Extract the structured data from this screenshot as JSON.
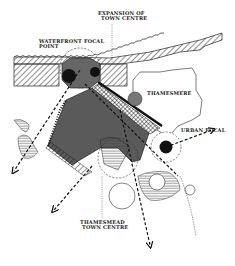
{
  "diagram": {
    "type": "urban-planning-concept-sketch",
    "labels": {
      "expansion_line1": "EXPANSION OF",
      "expansion_line2": "TOWN CENTRE",
      "waterfront_line1": "WATERFRONT FOCAL",
      "waterfront_line2": "POINT",
      "thamesmere": "THAMESMERE",
      "urban_focal": "URBAN FOCAL",
      "town_centre_line1": "THAMESMEAD",
      "town_centre_line2": "TOWN CENTRE"
    },
    "colors": {
      "ink": "#111111",
      "dark_fill": "#555555",
      "mid_fill": "#777777",
      "background": "#ffffff"
    }
  }
}
